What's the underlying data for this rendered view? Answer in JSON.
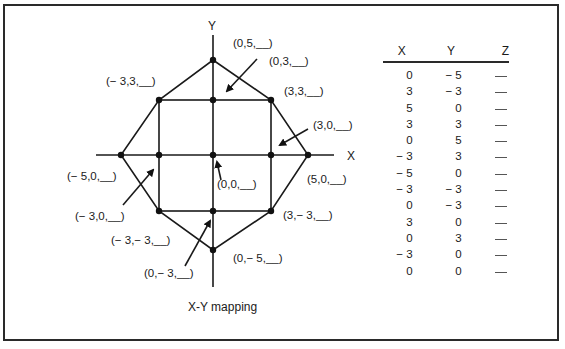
{
  "diagram": {
    "axis_x_label": "X",
    "axis_y_label": "Y",
    "caption": "X-Y mapping",
    "points": [
      {
        "x": 0,
        "y": 5,
        "label": "(0,5,__)"
      },
      {
        "x": 0,
        "y": 3,
        "label": "(0,3,__)"
      },
      {
        "x": -3,
        "y": 3,
        "label": "(− 3,3,__)"
      },
      {
        "x": 3,
        "y": 3,
        "label": "(3,3,__)"
      },
      {
        "x": 3,
        "y": 0,
        "label": "(3,0,__)"
      },
      {
        "x": -5,
        "y": 0,
        "label": "(− 5,0,__)"
      },
      {
        "x": 0,
        "y": 0,
        "label": "(0,0,__)"
      },
      {
        "x": 5,
        "y": 0,
        "label": "(5,0,__)"
      },
      {
        "x": -3,
        "y": 0,
        "label": "(− 3,0,__)"
      },
      {
        "x": 3,
        "y": -3,
        "label": "(3,− 3,__)"
      },
      {
        "x": -3,
        "y": -3,
        "label": "(− 3,− 3,__)"
      },
      {
        "x": 0,
        "y": -5,
        "label": "(0,− 5,__)"
      },
      {
        "x": 0,
        "y": -3,
        "label": "(0,− 3,__)"
      }
    ]
  },
  "table": {
    "headers": [
      "X",
      "Y",
      "Z"
    ],
    "rows": [
      [
        "0",
        "− 5",
        ""
      ],
      [
        "3",
        "− 3",
        ""
      ],
      [
        "5",
        "0",
        ""
      ],
      [
        "3",
        "3",
        ""
      ],
      [
        "0",
        "5",
        ""
      ],
      [
        "− 3",
        "3",
        ""
      ],
      [
        "− 5",
        "0",
        ""
      ],
      [
        "− 3",
        "− 3",
        ""
      ],
      [
        "0",
        "− 3",
        ""
      ],
      [
        "3",
        "0",
        ""
      ],
      [
        "0",
        "3",
        ""
      ],
      [
        "− 3",
        "0",
        ""
      ],
      [
        "0",
        "0",
        ""
      ]
    ]
  }
}
